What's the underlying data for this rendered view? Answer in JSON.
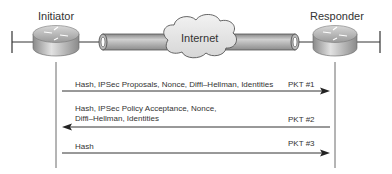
{
  "diagram": {
    "initiator_label": "Initiator",
    "responder_label": "Responder",
    "cloud_label": "Internet",
    "messages": [
      {
        "direction": "initiator-to-responder",
        "line1": "Hash, IPSec Proposals, Nonce, Diffi–Hellman, Identities",
        "line2": "",
        "packet": "PKT #1"
      },
      {
        "direction": "responder-to-initiator",
        "line1": "Hash, IPSec Policy Acceptance, Nonce,",
        "line2": "Diffi–Hellman, Identities",
        "packet": "PKT #2"
      },
      {
        "direction": "initiator-to-responder",
        "line1": "Hash",
        "line2": "",
        "packet": "PKT #3"
      }
    ]
  }
}
